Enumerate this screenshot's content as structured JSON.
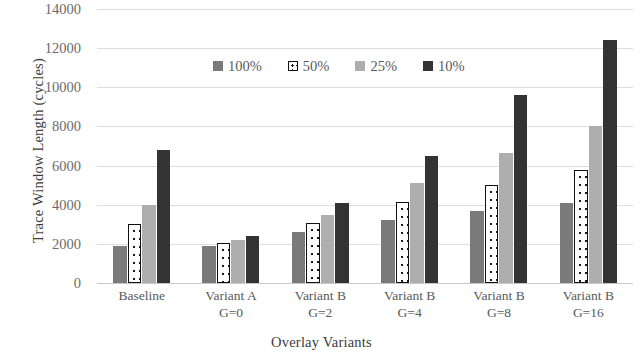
{
  "chart_data": {
    "type": "bar",
    "title": "",
    "xlabel": "Overlay Variants",
    "ylabel": "Trace Window Length (cycles)",
    "ylim": [
      0,
      14000
    ],
    "yticks": [
      0,
      2000,
      4000,
      6000,
      8000,
      10000,
      12000,
      14000
    ],
    "ytick_labels": [
      "0",
      "2000",
      "4000",
      "6000",
      "8000",
      "10000",
      "12000",
      "14000"
    ],
    "grid": true,
    "legend_position": "top-center",
    "categories": [
      {
        "line1": "Baseline",
        "line2": ""
      },
      {
        "line1": "Variant A",
        "line2": "G=0"
      },
      {
        "line1": "Variant B",
        "line2": "G=2"
      },
      {
        "line1": "Variant B",
        "line2": "G=4"
      },
      {
        "line1": "Variant B",
        "line2": "G=8"
      },
      {
        "line1": "Variant B",
        "line2": "G=16"
      }
    ],
    "series": [
      {
        "name": "100%",
        "color": "#7a7a7a",
        "pattern": "solid-gray",
        "values": [
          1900,
          1900,
          2600,
          3200,
          3700,
          4100
        ]
      },
      {
        "name": "50%",
        "color": "#ffffff",
        "pattern": "dotted-outline",
        "values": [
          3000,
          2050,
          3050,
          4150,
          5000,
          5800
        ]
      },
      {
        "name": "25%",
        "color": "#aeaeae",
        "pattern": "solid-lightgray",
        "values": [
          4000,
          2200,
          3500,
          5100,
          6650,
          8000
        ]
      },
      {
        "name": "10%",
        "color": "#333333",
        "pattern": "solid-dark",
        "values": [
          6800,
          2400,
          4100,
          6500,
          9600,
          12400
        ]
      }
    ]
  }
}
